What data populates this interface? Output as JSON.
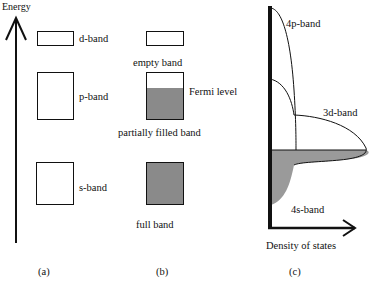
{
  "panel_a": {
    "axis_label": "Energy",
    "bands": [
      {
        "label": "d-band"
      },
      {
        "label": "p-band"
      },
      {
        "label": "s-band"
      }
    ],
    "caption": "(a)"
  },
  "panel_b": {
    "bands": [
      {
        "label": "empty band",
        "fill": "empty"
      },
      {
        "label": "partially filled band",
        "fill": "partial"
      },
      {
        "label": "full band",
        "fill": "full"
      }
    ],
    "fermi_label": "Fermi level",
    "caption": "(b)"
  },
  "panel_c": {
    "curves": [
      {
        "label": "4p-band"
      },
      {
        "label": "3d-band"
      },
      {
        "label": "4s-band"
      }
    ],
    "x_axis_label": "Density of states",
    "caption": "(c)"
  },
  "colors": {
    "line": "#111111",
    "filled": "#8a8a8a",
    "background": "#ffffff"
  }
}
